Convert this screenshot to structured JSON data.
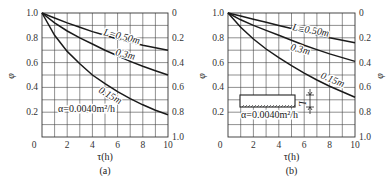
{
  "chart_data": [
    {
      "panel": "(a)",
      "type": "line",
      "title": "",
      "xlabel": "τ(h)",
      "ylabel_left": "φ",
      "ylabel_right": "",
      "x_ticks": [
        "0",
        "2",
        "4",
        "6",
        "8",
        "10"
      ],
      "y_ticks_left": [
        "1.0",
        "0.8",
        "0.6",
        "0.4",
        "0.2"
      ],
      "y_ticks_right": [
        "0",
        "0.2",
        "0.4",
        "0.6",
        "0.8",
        "1.0"
      ],
      "xlim": [
        0,
        10
      ],
      "ylim": [
        0,
        1.0
      ],
      "grid": true,
      "annotation": "α=0.0040m²/h",
      "caption": "(a)",
      "x": [
        0,
        1,
        2,
        3,
        4,
        5,
        6,
        7,
        8,
        9,
        10
      ],
      "series": [
        {
          "name": "L=0.50m",
          "label": "L=0.50m",
          "values": [
            1.0,
            0.96,
            0.92,
            0.885,
            0.85,
            0.82,
            0.79,
            0.765,
            0.74,
            0.72,
            0.7
          ]
        },
        {
          "name": "0.3m",
          "label": "0.3m",
          "values": [
            1.0,
            0.92,
            0.855,
            0.8,
            0.75,
            0.7,
            0.655,
            0.61,
            0.57,
            0.535,
            0.5
          ]
        },
        {
          "name": "0.15m",
          "label": "0.15m",
          "values": [
            1.0,
            0.82,
            0.69,
            0.59,
            0.5,
            0.43,
            0.365,
            0.31,
            0.26,
            0.215,
            0.18
          ]
        }
      ]
    },
    {
      "panel": "(b)",
      "type": "line",
      "title": "",
      "xlabel": "τ(h)",
      "ylabel_left": "φ",
      "ylabel_right": "φ",
      "x_ticks": [
        "0",
        "2",
        "4",
        "6",
        "8",
        "10"
      ],
      "y_ticks_left": [
        "1.0",
        "0.8",
        "0.6",
        "0.4",
        "0.2"
      ],
      "y_ticks_right": [
        "0",
        "0.2",
        "0.4",
        "0.6",
        "0.8",
        "1.0"
      ],
      "xlim": [
        0,
        10
      ],
      "ylim": [
        0,
        1.0
      ],
      "grid": true,
      "annotation": "α=0.0040m²/h",
      "inset": "slab of thickness L, insulated bottom",
      "inset_label": "L",
      "caption": "(b)",
      "x": [
        0,
        1,
        2,
        3,
        4,
        5,
        6,
        7,
        8,
        9,
        10
      ],
      "series": [
        {
          "name": "L=0.50m",
          "label": "L=0.50m",
          "values": [
            1.0,
            0.975,
            0.95,
            0.925,
            0.9,
            0.875,
            0.85,
            0.825,
            0.8,
            0.78,
            0.76
          ]
        },
        {
          "name": "0.3m",
          "label": "0.3m",
          "values": [
            1.0,
            0.945,
            0.9,
            0.86,
            0.82,
            0.78,
            0.74,
            0.705,
            0.67,
            0.64,
            0.61
          ]
        },
        {
          "name": "0.15m",
          "label": "0.15m",
          "values": [
            1.0,
            0.885,
            0.79,
            0.71,
            0.64,
            0.575,
            0.515,
            0.46,
            0.41,
            0.365,
            0.32
          ]
        }
      ]
    }
  ],
  "labels": {
    "a": {
      "xlabel": "τ(h)",
      "ylabel": "φ",
      "caption": "(a)",
      "alpha": "α=0.0040m²/h",
      "curve_labels": [
        "L=0.50m",
        "0.3m",
        "0.15m"
      ]
    },
    "b": {
      "xlabel": "τ(h)",
      "ylabel_left": "φ",
      "ylabel_right": "φ",
      "caption": "(b)",
      "alpha": "α=0.0040m²/h",
      "curve_labels": [
        "L=0.50m",
        "0.3m",
        "0.15m"
      ],
      "inset_L": "L"
    }
  }
}
